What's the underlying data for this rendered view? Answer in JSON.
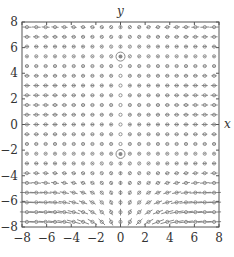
{
  "chart_data": {
    "type": "vector_field",
    "title": "",
    "xlabel": "x",
    "ylabel": "y",
    "xlim": [
      -8,
      8
    ],
    "ylim": [
      -8,
      8
    ],
    "xticks": [
      -8,
      -6,
      -4,
      -2,
      0,
      2,
      4,
      6,
      8
    ],
    "yticks": [
      -8,
      -6,
      -4,
      -2,
      0,
      2,
      4,
      6,
      8
    ],
    "xtick_labels": [
      "−8",
      "−6",
      "−4",
      "−2",
      "0",
      "2",
      "4",
      "6",
      "8"
    ],
    "ytick_labels": [
      "−8",
      "−6",
      "−4",
      "−2",
      "0",
      "2",
      "4",
      "6",
      "8"
    ],
    "grid": false,
    "legend": null,
    "field_grid": {
      "n": 21,
      "min": -7.6,
      "max": 7.6
    },
    "equilibrium_points": [
      {
        "x": 0,
        "y": 5.3,
        "marker": "circle"
      },
      {
        "x": 0,
        "y": -2.3,
        "marker": "circle"
      }
    ],
    "colors": {
      "arrow": "#7a7a7a",
      "frame": "#555555",
      "marker": "#888888",
      "text": "#333333"
    }
  }
}
